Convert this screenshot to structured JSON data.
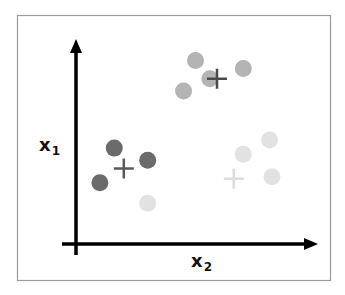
{
  "figure": {
    "x_axis_label": "x",
    "x_axis_subscript": "2",
    "y_axis_label": "x",
    "y_axis_subscript": "1"
  },
  "colors": {
    "frame": "#9a9a9a",
    "axis": "#000000",
    "cluster_dark": "#6b6b6b",
    "cluster_medium": "#b4b4b4",
    "cluster_light": "#e2e2e2",
    "centroid_dark": "#5a5a5a",
    "centroid_medium": "#4a4a4a",
    "centroid_light": "#dcdcdc"
  },
  "chart_data": {
    "type": "scatter",
    "title": "",
    "xlabel": "x2",
    "ylabel": "x1",
    "xlim": [
      0,
      100
    ],
    "ylim": [
      0,
      100
    ],
    "grid": false,
    "legend": "none",
    "clusters": [
      {
        "name": "dark",
        "color_key": "cluster_dark",
        "centroid_color_key": "centroid_dark",
        "points": [
          [
            16,
            47
          ],
          [
            30,
            41
          ],
          [
            10,
            30
          ]
        ],
        "centroid": [
          20,
          37
        ]
      },
      {
        "name": "medium",
        "color_key": "cluster_medium",
        "centroid_color_key": "centroid_medium",
        "points": [
          [
            50,
            90
          ],
          [
            70,
            86
          ],
          [
            56,
            81
          ],
          [
            45,
            75
          ]
        ],
        "centroid": [
          59,
          81
        ]
      },
      {
        "name": "light",
        "color_key": "cluster_light",
        "centroid_color_key": "centroid_light",
        "points": [
          [
            81,
            51
          ],
          [
            70,
            44
          ],
          [
            82,
            33
          ],
          [
            30,
            20
          ]
        ],
        "centroid": [
          66,
          32
        ]
      }
    ]
  }
}
